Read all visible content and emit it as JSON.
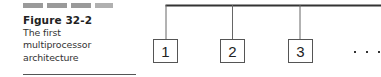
{
  "figure": {
    "label": "Figure 32-2",
    "caption_lines": [
      "The first",
      "multiprocessor",
      "architecture"
    ]
  },
  "diagram": {
    "type": "bus-architecture",
    "bus_color": "#333333",
    "connector_color": "#666666",
    "processors": [
      {
        "id": "1",
        "label": "1"
      },
      {
        "id": "2",
        "label": "2"
      },
      {
        "id": "3",
        "label": "3"
      }
    ],
    "continuation": "..."
  }
}
